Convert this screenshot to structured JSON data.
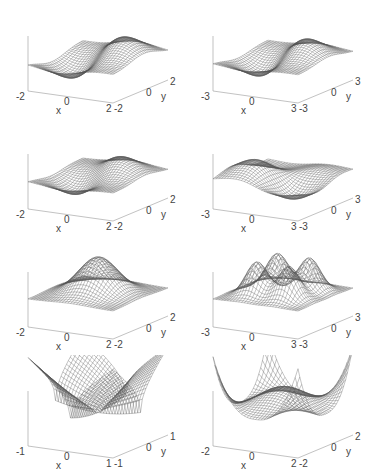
{
  "figure": {
    "layout": {
      "rows": 4,
      "cols": 2
    },
    "line_color": "#555555",
    "axis_color": "#999999"
  },
  "chart_data": [
    {
      "type": "surface",
      "panel": "row1-left",
      "xlabel": "x",
      "ylabel": "y",
      "xlim": [
        -2,
        2
      ],
      "ylim": [
        -2,
        2
      ],
      "xticks": [
        "-2",
        "0",
        "2"
      ],
      "yticks": [
        "-2",
        "0",
        "2"
      ],
      "description": "two positive peaks and one negative trough (odd mode)",
      "func": "m1"
    },
    {
      "type": "surface",
      "panel": "row1-right",
      "xlabel": "x",
      "ylabel": "y",
      "xlim": [
        -3,
        3
      ],
      "ylim": [
        -3,
        3
      ],
      "xticks": [
        "-3",
        "0",
        "3"
      ],
      "yticks": [
        "-3",
        "0",
        "3"
      ],
      "description": "two peaks and a trough, wider domain",
      "func": "m1w"
    },
    {
      "type": "surface",
      "panel": "row2-left",
      "xlabel": "x",
      "ylabel": "y",
      "xlim": [
        -2,
        2
      ],
      "ylim": [
        -2,
        2
      ],
      "xticks": [
        "-2",
        "0",
        "2"
      ],
      "yticks": [
        "-2",
        "0",
        "2"
      ],
      "description": "one peak and one trough",
      "func": "m2"
    },
    {
      "type": "surface",
      "panel": "row2-right",
      "xlabel": "x",
      "ylabel": "y",
      "xlim": [
        -3,
        3
      ],
      "ylim": [
        -3,
        3
      ],
      "xticks": [
        "-3",
        "0",
        "3"
      ],
      "yticks": [
        "-3",
        "0",
        "3"
      ],
      "description": "multiple peaks and troughs",
      "func": "m2w"
    },
    {
      "type": "surface",
      "panel": "row3-left",
      "xlabel": "x",
      "ylabel": "y",
      "xlim": [
        -2,
        2
      ],
      "ylim": [
        -2,
        2
      ],
      "xticks": [
        "-2",
        "0",
        "2"
      ],
      "yticks": [
        "-2",
        "0",
        "2"
      ],
      "description": "single Gaussian bump",
      "func": "gauss"
    },
    {
      "type": "surface",
      "panel": "row3-right",
      "xlabel": "x",
      "ylabel": "y",
      "xlim": [
        -3,
        3
      ],
      "ylim": [
        -3,
        3
      ],
      "xticks": [
        "-3",
        "0",
        "3"
      ],
      "yticks": [
        "-3",
        "0",
        "3"
      ],
      "description": "four positive peaks",
      "func": "four"
    },
    {
      "type": "surface",
      "panel": "row4-left",
      "xlabel": "x",
      "ylabel": "y",
      "xlim": [
        -1,
        1
      ],
      "ylim": [
        -1,
        1
      ],
      "xticks": [
        "-1",
        "0",
        "1"
      ],
      "yticks": [
        "-1",
        "0",
        "1"
      ],
      "description": "bowl with sharp corner spikes",
      "func": "bowl"
    },
    {
      "type": "surface",
      "panel": "row4-right",
      "xlabel": "x",
      "ylabel": "y",
      "xlim": [
        -2,
        2
      ],
      "ylim": [
        -2,
        2
      ],
      "xticks": [
        "-2",
        "0",
        "2"
      ],
      "yticks": [
        "-2",
        "0",
        "2"
      ],
      "description": "central broad hump with raised corners",
      "func": "hump"
    }
  ]
}
